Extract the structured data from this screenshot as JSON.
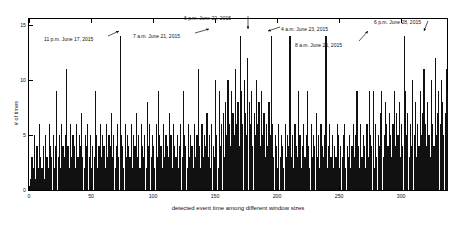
{
  "chart_data": {
    "type": "bar",
    "title": "",
    "xlabel": "detected event time among different window sizes",
    "ylabel": "# of times",
    "xlim": [
      0,
      337
    ],
    "ylim": [
      0,
      15.5
    ],
    "grid": false,
    "legend": null,
    "bar_color": "#111111",
    "xticks": [
      0,
      50,
      100,
      150,
      200,
      250,
      300
    ],
    "yticks": [
      0,
      5,
      10,
      15
    ],
    "categories_note": "x is the index of detected event time among different window sizes (1..337)",
    "values": [
      1,
      3,
      2,
      5,
      1,
      4,
      2,
      6,
      3,
      2,
      4,
      1,
      5,
      3,
      2,
      6,
      4,
      3,
      5,
      2,
      4,
      9,
      3,
      5,
      2,
      6,
      4,
      3,
      5,
      11,
      4,
      2,
      6,
      3,
      5,
      4,
      2,
      6,
      3,
      5,
      4,
      7,
      3,
      2,
      5,
      4,
      6,
      3,
      5,
      2,
      4,
      3,
      9,
      5,
      2,
      4,
      6,
      3,
      5,
      4,
      2,
      6,
      3,
      5,
      4,
      7,
      3,
      5,
      2,
      4,
      6,
      3,
      14,
      5,
      4,
      2,
      6,
      3,
      5,
      4,
      3,
      6,
      2,
      5,
      4,
      7,
      3,
      5,
      2,
      6,
      4,
      3,
      5,
      2,
      8,
      4,
      6,
      3,
      5,
      4,
      2,
      6,
      3,
      9,
      5,
      4,
      2,
      6,
      3,
      5,
      4,
      3,
      7,
      5,
      2,
      6,
      4,
      3,
      5,
      2,
      4,
      6,
      3,
      9,
      5,
      4,
      2,
      6,
      3,
      5,
      4,
      2,
      6,
      3,
      5,
      11,
      4,
      2,
      6,
      3,
      5,
      4,
      7,
      3,
      5,
      2,
      6,
      4,
      3,
      10,
      5,
      2,
      9,
      4,
      6,
      7,
      3,
      8,
      5,
      10,
      6,
      4,
      9,
      7,
      5,
      11,
      6,
      8,
      4,
      14,
      9,
      6,
      10,
      7,
      5,
      12,
      8,
      6,
      9,
      4,
      7,
      5,
      10,
      6,
      8,
      4,
      9,
      5,
      7,
      3,
      6,
      4,
      8,
      5,
      14,
      6,
      3,
      5,
      4,
      2,
      6,
      3,
      5,
      4,
      2,
      6,
      3,
      5,
      4,
      14,
      3,
      5,
      2,
      6,
      4,
      3,
      9,
      5,
      2,
      4,
      6,
      3,
      5,
      9,
      4,
      2,
      6,
      3,
      5,
      4,
      7,
      3,
      5,
      2,
      6,
      4,
      3,
      5,
      14,
      2,
      4,
      6,
      3,
      5,
      2,
      4,
      3,
      6,
      5,
      2,
      4,
      3,
      5,
      6,
      2,
      4,
      3,
      5,
      2,
      4,
      6,
      3,
      5,
      9,
      4,
      2,
      6,
      3,
      5,
      4,
      2,
      6,
      3,
      9,
      5,
      4,
      9,
      2,
      6,
      3,
      5,
      4,
      7,
      9,
      3,
      5,
      8,
      6,
      4,
      7,
      5,
      3,
      6,
      9,
      4,
      7,
      5,
      8,
      3,
      6,
      4,
      14,
      9,
      5,
      7,
      3,
      6,
      4,
      10,
      5,
      8,
      3,
      6,
      4,
      9,
      5,
      7,
      11,
      6,
      4,
      8,
      5,
      3,
      10,
      6,
      4,
      12,
      5,
      7,
      9,
      6,
      10,
      8,
      5,
      7,
      11,
      9
    ],
    "annotations": [
      {
        "id": "a1",
        "label": "11 p.m. June 17, 2015",
        "x_index": 73,
        "y_value": 14,
        "text_x": 44,
        "text_y": 36,
        "arrow_from_x": 108,
        "arrow_from_y": 36,
        "arrow_to_x": 119,
        "arrow_to_y": 31
      },
      {
        "id": "a2",
        "label": "7 a.m. June 21, 2015",
        "x_index": 170,
        "y_value": 14,
        "text_x": 133,
        "text_y": 33,
        "arrow_from_x": 195,
        "arrow_from_y": 33,
        "arrow_to_x": 209,
        "arrow_to_y": 29
      },
      {
        "id": "a3",
        "label": "6 p.m. June 22, 2015",
        "x_index": 200,
        "y_value": 14,
        "text_x": 184,
        "text_y": 15,
        "arrow_from_x": 248,
        "arrow_from_y": 16,
        "arrow_to_x": 248,
        "arrow_to_y": 29
      },
      {
        "id": "a4",
        "label": "4 a.m. June 23, 2015",
        "x_index": 210,
        "y_value": 14,
        "text_x": 281,
        "text_y": 26,
        "arrow_from_x": 280,
        "arrow_from_y": 27,
        "arrow_to_x": 268,
        "arrow_to_y": 31
      },
      {
        "id": "a5",
        "label": "8 a.m. June 26, 2015",
        "x_index": 249,
        "y_value": 14,
        "text_x": 295,
        "text_y": 42,
        "arrow_from_x": 359,
        "arrow_from_y": 41,
        "arrow_to_x": 368,
        "arrow_to_y": 31
      },
      {
        "id": "a6",
        "label": "6 p.m. June 28, 2015",
        "x_index": 311,
        "y_value": 14,
        "text_x": 374,
        "text_y": 19,
        "arrow_from_x": 428,
        "arrow_from_y": 21,
        "arrow_to_x": 424,
        "arrow_to_y": 31
      }
    ]
  }
}
